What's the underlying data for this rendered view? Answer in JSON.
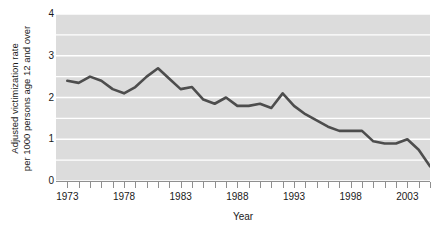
{
  "chart_data": {
    "type": "line",
    "title": "",
    "subtitle": "",
    "xlabel": "Year",
    "ylabel_line1": "Adjusted victimization rate",
    "ylabel_line2": "per 1000 persons age 12 and over",
    "xlim": [
      1972,
      2005
    ],
    "ylim": [
      0,
      4
    ],
    "grid": true,
    "grid_orientation": "horizontal",
    "grid_step": 0.5,
    "legend": "none",
    "y_ticks": [
      0,
      1,
      2,
      3,
      4
    ],
    "y_tick_labels": [
      "0",
      "1",
      "2",
      "3",
      "4"
    ],
    "x_ticks": [
      1973,
      1974,
      1975,
      1976,
      1977,
      1978,
      1979,
      1980,
      1981,
      1982,
      1983,
      1984,
      1985,
      1986,
      1987,
      1988,
      1989,
      1990,
      1991,
      1992,
      1993,
      1994,
      1995,
      1996,
      1997,
      1998,
      1999,
      2000,
      2001,
      2002,
      2003,
      2004,
      2005
    ],
    "x_tick_labels": [
      "1973",
      "1978",
      "1983",
      "1988",
      "1993",
      "1998",
      "2003"
    ],
    "x_labeled_ticks": [
      1973,
      1978,
      1983,
      1988,
      1993,
      1998,
      2003
    ],
    "x": [
      1973,
      1974,
      1975,
      1976,
      1977,
      1978,
      1979,
      1980,
      1981,
      1982,
      1983,
      1984,
      1985,
      1986,
      1987,
      1988,
      1989,
      1990,
      1991,
      1992,
      1993,
      1994,
      1995,
      1996,
      1997,
      1998,
      1999,
      2000,
      2001,
      2002,
      2003,
      2004,
      2005
    ],
    "values": [
      2.4,
      2.35,
      2.5,
      2.4,
      2.2,
      2.1,
      2.25,
      2.5,
      2.7,
      2.45,
      2.2,
      2.25,
      1.95,
      1.85,
      2.0,
      1.8,
      1.8,
      1.85,
      1.75,
      2.1,
      1.8,
      1.6,
      1.45,
      1.3,
      1.2,
      1.2,
      1.2,
      0.95,
      0.9,
      0.9,
      1.0,
      0.75,
      0.35
    ],
    "series": [
      {
        "name": "Adjusted victimization rate",
        "color": "#4d4d4d",
        "values": [
          2.4,
          2.35,
          2.5,
          2.4,
          2.2,
          2.1,
          2.25,
          2.5,
          2.7,
          2.45,
          2.2,
          2.25,
          1.95,
          1.85,
          2.0,
          1.8,
          1.8,
          1.85,
          1.75,
          2.1,
          1.8,
          1.6,
          1.45,
          1.3,
          1.2,
          1.2,
          1.2,
          0.95,
          0.9,
          0.9,
          1.0,
          0.75,
          0.35
        ]
      }
    ],
    "colors": {
      "line": "#4d4d4d",
      "plot_background": "#dcdcdc",
      "gridline": "#ffffff",
      "axis": "#8f8f8f",
      "text": "#1a1a1a",
      "page_background": "#ffffff"
    }
  }
}
